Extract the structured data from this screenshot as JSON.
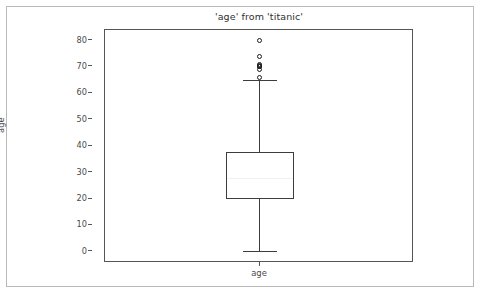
{
  "figure": {
    "title": "'age' from 'titanic'",
    "background_color": "#ffffff",
    "border_color": "#b9b9b9"
  },
  "axes": {
    "xlabel": "age",
    "ylabel": "age",
    "xtick_labels": [
      "age"
    ],
    "ytick_labels": [
      "0",
      "10",
      "20",
      "30",
      "40",
      "50",
      "60",
      "70",
      "80"
    ],
    "spine_color": "#555555",
    "ylim": [
      -4.2,
      84.0
    ],
    "grid": false
  },
  "chart_data": {
    "type": "box",
    "title": "'age' from 'titanic'",
    "xlabel": "age",
    "ylabel": "age",
    "categories": [
      "age"
    ],
    "ylim": [
      -4.2,
      84.0
    ],
    "yticks": [
      0,
      10,
      20,
      30,
      40,
      50,
      60,
      70,
      80
    ],
    "grid": false,
    "legend": null,
    "orientation": "vertical",
    "boxes": [
      {
        "label": "age",
        "q1": 20.125,
        "median": 28.0,
        "q3": 38.0,
        "whisker_low": 0.42,
        "whisker_high": 65.0,
        "fliers": [
          80.0,
          74.0,
          71.0,
          70.5,
          70.0,
          70.0,
          69.0,
          66.0
        ],
        "box_facecolor": "#ffffff",
        "box_edgecolor": "#3d3d3d",
        "median_color": "#f2f0f0",
        "flier_marker": "circle-open"
      }
    ]
  }
}
